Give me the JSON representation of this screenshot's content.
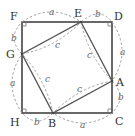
{
  "diagram": {
    "points": {
      "F": {
        "label": "F",
        "x": 22,
        "y": 22
      },
      "E": {
        "label": "E",
        "x": 81,
        "y": 22
      },
      "D": {
        "label": "D",
        "x": 112,
        "y": 22
      },
      "A": {
        "label": "A",
        "x": 112,
        "y": 81
      },
      "C": {
        "label": "C",
        "x": 112,
        "y": 113
      },
      "B": {
        "label": "B",
        "x": 53,
        "y": 113
      },
      "H": {
        "label": "H",
        "x": 22,
        "y": 113
      },
      "G": {
        "label": "G",
        "x": 22,
        "y": 54
      }
    },
    "segment_labels": {
      "FE": "a",
      "ED": "b",
      "DA": "a",
      "AC": "b",
      "CB": "a",
      "BH": "b",
      "HG": "a",
      "GF": "b",
      "EA": "c",
      "AB": "c",
      "BG": "c",
      "GE": "c"
    },
    "colors": {
      "outline": "#444444",
      "dashed": "#999999",
      "label": "#333333"
    }
  }
}
